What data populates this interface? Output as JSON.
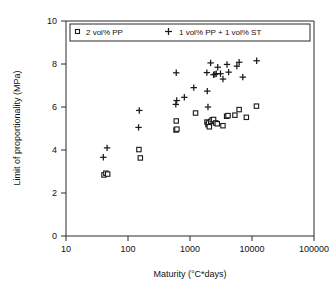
{
  "chart_data": {
    "type": "scatter",
    "title": "",
    "xlabel": "Maturity (°C*days)",
    "ylabel": "Limit of proportionality (MPa)",
    "xscale": "log",
    "yscale": "linear",
    "xlim": [
      10,
      100000
    ],
    "ylim": [
      0,
      10
    ],
    "xticks": [
      10,
      100,
      1000,
      10000,
      100000
    ],
    "xtick_labels": [
      "10",
      "100",
      "1000",
      "10000",
      "100000"
    ],
    "yticks": [
      0,
      2,
      4,
      6,
      8,
      10
    ],
    "ytick_labels": [
      "0",
      "2",
      "4",
      "6",
      "8",
      "10"
    ],
    "grid": false,
    "legend_position": "top-inside",
    "series": [
      {
        "name": "2 vol% PP",
        "marker": "open-square",
        "points": [
          [
            41,
            2.84
          ],
          [
            44,
            2.92
          ],
          [
            47,
            2.88
          ],
          [
            150,
            4.02
          ],
          [
            158,
            3.63
          ],
          [
            600,
            5.35
          ],
          [
            595,
            4.93
          ],
          [
            615,
            4.97
          ],
          [
            1230,
            5.72
          ],
          [
            1880,
            5.3
          ],
          [
            1950,
            5.18
          ],
          [
            1990,
            5.26
          ],
          [
            2050,
            5.08
          ],
          [
            2150,
            5.33
          ],
          [
            2280,
            5.4
          ],
          [
            2400,
            5.42
          ],
          [
            2600,
            5.26
          ],
          [
            2750,
            5.22
          ],
          [
            3400,
            5.13
          ],
          [
            3900,
            5.57
          ],
          [
            4100,
            5.6
          ],
          [
            5300,
            5.62
          ],
          [
            6200,
            5.88
          ],
          [
            8100,
            5.52
          ],
          [
            11800,
            6.04
          ]
        ]
      },
      {
        "name": "1 vol% PP + 1 vol% ST",
        "marker": "plus",
        "points": [
          [
            40,
            3.66
          ],
          [
            46,
            4.1
          ],
          [
            148,
            5.05
          ],
          [
            152,
            5.84
          ],
          [
            590,
            6.12
          ],
          [
            610,
            6.3
          ],
          [
            600,
            7.59
          ],
          [
            810,
            6.45
          ],
          [
            1150,
            6.9
          ],
          [
            1870,
            7.6
          ],
          [
            1900,
            6.74
          ],
          [
            1950,
            6.0
          ],
          [
            2150,
            8.05
          ],
          [
            2400,
            7.5
          ],
          [
            2520,
            7.52
          ],
          [
            2650,
            7.55
          ],
          [
            2800,
            7.85
          ],
          [
            3100,
            7.55
          ],
          [
            3400,
            7.3
          ],
          [
            3950,
            7.98
          ],
          [
            4200,
            7.62
          ],
          [
            5700,
            7.9
          ],
          [
            6200,
            8.08
          ],
          [
            7100,
            7.39
          ],
          [
            11900,
            8.15
          ]
        ]
      }
    ]
  },
  "legend": {
    "entries": [
      {
        "label": "2 vol% PP",
        "marker": "open-square"
      },
      {
        "label": "1 vol% PP + 1 vol% ST",
        "marker": "plus"
      }
    ]
  }
}
